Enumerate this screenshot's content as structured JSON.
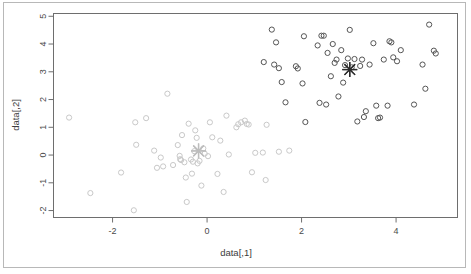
{
  "figure": {
    "type": "scatter-plot",
    "renderer": "r-base-graphics",
    "xlabel": "data[,1]",
    "ylabel": "data[,2]"
  },
  "axes": {
    "x_ticks": [
      "-2",
      "0",
      "2",
      "4"
    ],
    "x_tick_values": [
      -2,
      0,
      2,
      4
    ],
    "y_ticks": [
      "-2",
      "-1",
      "0",
      "1",
      "2",
      "3",
      "4",
      "5"
    ],
    "y_tick_values": [
      -2,
      -1,
      0,
      1,
      2,
      3,
      4,
      5
    ],
    "xlim": [
      -3.25,
      5.3
    ],
    "ylim": [
      -2.25,
      5.1
    ],
    "frame_color": "#6e6e6e",
    "tick_text_color": "#4a4a4a"
  },
  "chart_data": {
    "type": "scatter",
    "title": "",
    "xlabel": "data[,1]",
    "ylabel": "data[,2]",
    "xlim": [
      -3.25,
      5.3
    ],
    "ylim": [
      -2.25,
      5.1
    ],
    "grid": false,
    "legend": "none",
    "marker": "open-circle",
    "marker_radius_px": 2.6,
    "series": [
      {
        "name": "cluster-1",
        "color": "#c9c9c9",
        "symbol": "circle",
        "points": [
          [
            -2.92,
            1.35
          ],
          [
            -2.47,
            -1.37
          ],
          [
            -1.82,
            -0.63
          ],
          [
            -1.55,
            -1.99
          ],
          [
            -1.52,
            1.18
          ],
          [
            -1.5,
            0.37
          ],
          [
            -1.29,
            1.33
          ],
          [
            -1.12,
            0.16
          ],
          [
            -1.06,
            -0.46
          ],
          [
            -0.98,
            -0.09
          ],
          [
            -0.93,
            -0.41
          ],
          [
            -0.84,
            2.21
          ],
          [
            -0.72,
            -0.36
          ],
          [
            -0.62,
            0.36
          ],
          [
            -0.58,
            -0.03
          ],
          [
            -0.57,
            -0.15
          ],
          [
            -0.55,
            -0.18
          ],
          [
            -0.53,
            0.72
          ],
          [
            -0.48,
            -0.26
          ],
          [
            -0.45,
            -0.81
          ],
          [
            -0.43,
            -1.69
          ],
          [
            -0.39,
            1.13
          ],
          [
            -0.34,
            -0.16
          ],
          [
            -0.32,
            -0.67
          ],
          [
            -0.3,
            -0.24
          ],
          [
            -0.27,
            0.14
          ],
          [
            -0.25,
            0.89
          ],
          [
            -0.22,
            0.62
          ],
          [
            -0.2,
            -0.3
          ],
          [
            -0.16,
            -0.21
          ],
          [
            -0.12,
            -1.1
          ],
          [
            -0.08,
            0.24
          ],
          [
            -0.05,
            0.05
          ],
          [
            0.02,
            -0.04
          ],
          [
            0.06,
            1.18
          ],
          [
            0.11,
            0.64
          ],
          [
            0.22,
            -0.68
          ],
          [
            0.28,
            0.52
          ],
          [
            0.35,
            -1.33
          ],
          [
            0.41,
            1.42
          ],
          [
            0.46,
            0.02
          ],
          [
            0.62,
            1.0
          ],
          [
            0.66,
            1.11
          ],
          [
            0.72,
            1.18
          ],
          [
            0.8,
            1.24
          ],
          [
            0.84,
            1.12
          ],
          [
            0.88,
            1.1
          ],
          [
            0.95,
            -0.62
          ],
          [
            1.02,
            0.08
          ],
          [
            1.18,
            0.09
          ],
          [
            1.24,
            -0.9
          ],
          [
            1.26,
            1.09
          ],
          [
            1.52,
            0.12
          ],
          [
            1.74,
            0.16
          ]
        ]
      },
      {
        "name": "cluster-2",
        "color": "#555555",
        "symbol": "circle",
        "points": [
          [
            1.2,
            3.35
          ],
          [
            1.37,
            4.52
          ],
          [
            1.42,
            3.26
          ],
          [
            1.46,
            4.06
          ],
          [
            1.52,
            3.13
          ],
          [
            1.58,
            2.63
          ],
          [
            1.66,
            1.9
          ],
          [
            1.88,
            3.2
          ],
          [
            1.92,
            3.12
          ],
          [
            2.02,
            2.58
          ],
          [
            2.05,
            4.28
          ],
          [
            2.08,
            1.19
          ],
          [
            2.34,
            3.95
          ],
          [
            2.38,
            1.88
          ],
          [
            2.42,
            4.3
          ],
          [
            2.47,
            4.3
          ],
          [
            2.52,
            1.82
          ],
          [
            2.55,
            3.68
          ],
          [
            2.62,
            2.84
          ],
          [
            2.66,
            4.0
          ],
          [
            2.7,
            3.32
          ],
          [
            2.74,
            3.44
          ],
          [
            2.78,
            2.11
          ],
          [
            2.84,
            3.78
          ],
          [
            2.88,
            2.61
          ],
          [
            2.92,
            3.24
          ],
          [
            2.98,
            3.48
          ],
          [
            3.02,
            4.51
          ],
          [
            3.06,
            3.16
          ],
          [
            3.12,
            3.46
          ],
          [
            3.18,
            1.21
          ],
          [
            3.24,
            3.21
          ],
          [
            3.28,
            3.44
          ],
          [
            3.32,
            1.37
          ],
          [
            3.36,
            1.58
          ],
          [
            3.44,
            3.26
          ],
          [
            3.52,
            4.03
          ],
          [
            3.58,
            1.78
          ],
          [
            3.62,
            1.33
          ],
          [
            3.66,
            1.35
          ],
          [
            3.74,
            3.44
          ],
          [
            3.82,
            1.78
          ],
          [
            3.86,
            4.1
          ],
          [
            3.9,
            4.06
          ],
          [
            3.94,
            3.52
          ],
          [
            4.02,
            3.38
          ],
          [
            4.1,
            3.78
          ],
          [
            4.38,
            1.82
          ],
          [
            4.56,
            3.26
          ],
          [
            4.62,
            2.39
          ],
          [
            4.7,
            4.7
          ],
          [
            4.8,
            3.76
          ],
          [
            4.84,
            3.66
          ]
        ]
      }
    ],
    "centroids": [
      {
        "name": "centroid-cluster-1",
        "x": -0.18,
        "y": 0.15,
        "color": "#bdbdbd",
        "symbol": "star"
      },
      {
        "name": "centroid-cluster-2",
        "x": 3.02,
        "y": 3.08,
        "color": "#2b2b2b",
        "symbol": "star"
      }
    ]
  }
}
